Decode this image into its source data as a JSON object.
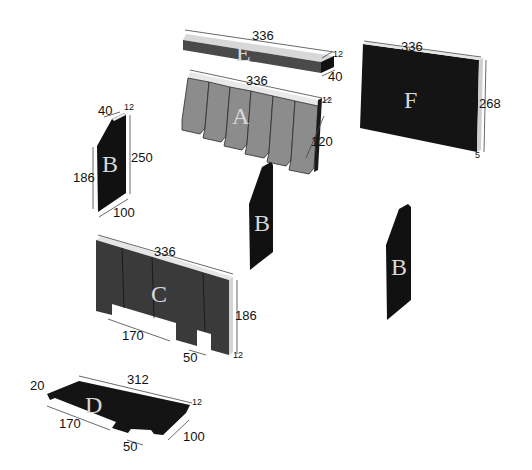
{
  "diagram": {
    "colors": {
      "part_dark": "#141414",
      "part_mid": "#3c3c3c",
      "part_light": "#8c8c8c",
      "part_edge": "#e6e6e6",
      "label": "#d9d9d9"
    },
    "parts": {
      "E": {
        "label": "E",
        "dims": {
          "length": "336",
          "thickness": "12",
          "width": "40"
        }
      },
      "A": {
        "label": "A",
        "dims": {
          "length": "336",
          "thickness": "12",
          "height": "120"
        }
      },
      "F": {
        "label": "F",
        "dims": {
          "length": "336",
          "height": "268",
          "thickness": "5"
        }
      },
      "B_left": {
        "label": "B",
        "dims": {
          "top": "40",
          "thickness": "12",
          "height_front": "186",
          "height_back": "250",
          "depth": "100"
        }
      },
      "B_center": {
        "label": "B"
      },
      "B_right": {
        "label": "B"
      },
      "C": {
        "label": "C",
        "dims": {
          "length": "336",
          "height": "186",
          "thickness": "12",
          "cutout_wide": "170",
          "cutout_narrow": "50"
        }
      },
      "D": {
        "label": "D",
        "dims": {
          "length": "312",
          "thickness": "12",
          "depth": "100",
          "offset": "20",
          "cutout_wide": "170",
          "cutout_narrow": "50"
        }
      }
    }
  }
}
